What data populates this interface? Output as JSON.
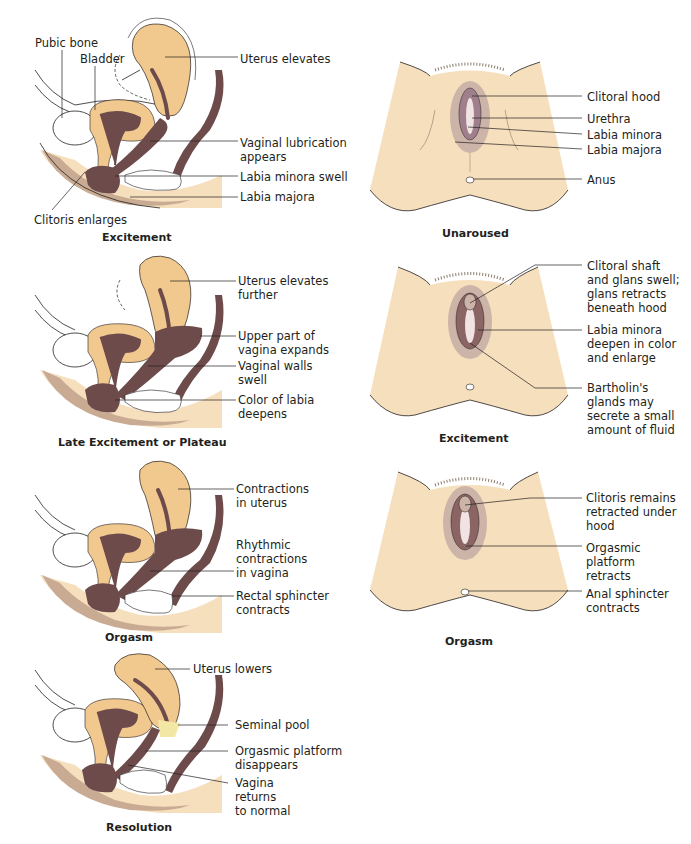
{
  "colors": {
    "skin": "#f6dfbd",
    "organ_tan": "#f1c88e",
    "tissue_dark": "#6e4b4b",
    "tissue_mid": "#8b6464",
    "labia_outer": "#cdb4a8",
    "labia_inner": "#9f7f8c",
    "floor_shadow": "#c9ab94",
    "seminal_pool": "#f3e7a6",
    "line": "#231f20"
  },
  "sagittal_panels": [
    {
      "caption": "Excitement",
      "labels": {
        "pubic_bone": "Pubic bone",
        "bladder": "Bladder",
        "uterus": "Uterus elevates",
        "lubrication": "Vaginal lubrication\nappears",
        "labia_minora": "Labia minora swell",
        "labia_majora": "Labia majora",
        "clitoris": "Clitoris enlarges"
      }
    },
    {
      "caption": "Late Excitement or Plateau",
      "labels": {
        "uterus": "Uterus elevates\nfurther",
        "upper_vagina": "Upper part of\nvagina expands",
        "vaginal_walls": "Vaginal walls\nswell",
        "labia_color": "Color of  labia\ndeepens"
      }
    },
    {
      "caption": "Orgasm",
      "labels": {
        "uterus": "Contractions\nin uterus",
        "vagina": "Rhythmic\ncontractions\nin vagina",
        "rectal": "Rectal sphincter\ncontracts"
      }
    },
    {
      "caption": "Resolution",
      "labels": {
        "uterus": "Uterus lowers",
        "seminal": "Seminal pool",
        "platform": "Orgasmic platform\ndisappears",
        "vagina": "Vagina\nreturns\nto normal"
      }
    }
  ],
  "external_panels": [
    {
      "caption": "Unaroused",
      "labels": {
        "l1": "Clitoral hood",
        "l2": "Urethra",
        "l3": "Labia minora",
        "l4": "Labia majora",
        "l5": "Anus"
      }
    },
    {
      "caption": "Excitement",
      "labels": {
        "l1": "Clitoral shaft\nand glans swell;\nglans retracts\nbeneath hood",
        "l2": "Labia minora\ndeepen in color\nand enlarge",
        "l3": "Bartholin's\nglands may\nsecrete a small\namount of fluid"
      }
    },
    {
      "caption": "Orgasm",
      "labels": {
        "l1": "Clitoris remains\nretracted under\nhood",
        "l2": "Orgasmic\nplatform\nretracts",
        "l3": "Anal sphincter\ncontracts"
      }
    }
  ]
}
